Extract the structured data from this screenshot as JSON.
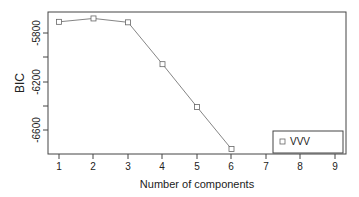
{
  "chart_data": {
    "type": "line",
    "title": "",
    "xlabel": "Number of components",
    "ylabel": "BIC",
    "x": [
      1,
      2,
      3,
      4,
      5,
      6,
      7,
      8,
      9
    ],
    "series": [
      {
        "name": "VVV",
        "marker": "open-square",
        "x": [
          1,
          2,
          3,
          4,
          5,
          6
        ],
        "values": [
          -5708,
          -5680,
          -5712,
          -6057,
          -6410,
          -6757
        ]
      }
    ],
    "xticks": [
      "1",
      "2",
      "3",
      "4",
      "5",
      "6",
      "7",
      "8",
      "9"
    ],
    "yticks": [
      "-5800",
      "-6200",
      "-6600"
    ],
    "ytick_values": [
      -5800,
      -6000,
      -6200,
      -6400,
      -6600
    ],
    "xlim": [
      0.7,
      9.3
    ],
    "ylim": [
      -6800,
      -5650
    ],
    "grid": false,
    "legend": {
      "position": "bottom-right",
      "entries": [
        "VVV"
      ]
    }
  }
}
